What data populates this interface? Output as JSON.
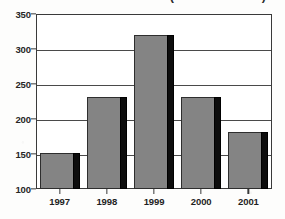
{
  "chart_data": {
    "type": "bar",
    "title": "(million dollars)",
    "xlabel": "",
    "ylabel": "",
    "categories": [
      "1997",
      "1998",
      "1999",
      "2000",
      "2001"
    ],
    "values": [
      151,
      231,
      320,
      231,
      181
    ],
    "ylim": [
      100,
      350
    ],
    "yticks": [
      100,
      150,
      200,
      250,
      300,
      350
    ],
    "ytick_labels": [
      "100",
      "150",
      "200",
      "250",
      "300",
      "350"
    ],
    "grid": true,
    "legend": null,
    "series": [
      {
        "name": "Amount",
        "values": [
          151,
          231,
          320,
          231,
          181
        ]
      }
    ],
    "bar_color": "#848484",
    "bar_shadow_color": "#0d0d0d",
    "axis_color": "#3a3a3a",
    "background_color": "#ffffff"
  }
}
